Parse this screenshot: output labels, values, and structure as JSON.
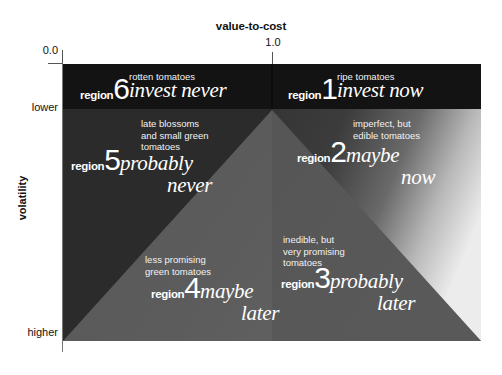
{
  "axes": {
    "x_title": "value-to-cost",
    "x_tick_origin": "0.0",
    "x_tick_one": "1.0",
    "y_title": "volatility",
    "y_tick_top": "lower",
    "y_tick_bottom": "higher"
  },
  "colors": {
    "header_band": "#111111",
    "left_quadrant": "#2b2b2b",
    "right_quadrant": "#3a3a3a",
    "triangle": "#5b5b5b",
    "gradient_light": "#e8e8e8",
    "text": "#ffffff",
    "page_background": "#ffffff",
    "axis_line": "#777777"
  },
  "regions": [
    {
      "id": "region-6",
      "label": "region",
      "number": "6",
      "caption": "rotten tomatoes",
      "action": "invest never",
      "action_line1": "invest never",
      "action_line2": ""
    },
    {
      "id": "region-1",
      "label": "region",
      "number": "1",
      "caption": "ripe tomatoes",
      "action": "invest now",
      "action_line1": "invest now",
      "action_line2": ""
    },
    {
      "id": "region-5",
      "label": "region",
      "number": "5",
      "caption": "late blossoms\nand small green\ntomatoes",
      "caption_line1": "late blossoms",
      "caption_line2": "and small green",
      "caption_line3": "tomatoes",
      "action": "probably never",
      "action_line1": "probably",
      "action_line2": "never"
    },
    {
      "id": "region-2",
      "label": "region",
      "number": "2",
      "caption": "imperfect, but\nedible tomatoes",
      "caption_line1": "imperfect, but",
      "caption_line2": "edible tomatoes",
      "caption_line3": "",
      "action": "maybe now",
      "action_line1": "maybe",
      "action_line2": "now"
    },
    {
      "id": "region-4",
      "label": "region",
      "number": "4",
      "caption": "less promising\ngreen tomatoes",
      "caption_line1": "less promising",
      "caption_line2": "green tomatoes",
      "caption_line3": "",
      "action": "maybe later",
      "action_line1": "maybe",
      "action_line2": "later"
    },
    {
      "id": "region-3",
      "label": "region",
      "number": "3",
      "caption": "inedible, but\nvery promising\ntomatoes",
      "caption_line1": "inedible, but",
      "caption_line2": "very promising",
      "caption_line3": "tomatoes",
      "action": "probably later",
      "action_line1": "probably",
      "action_line2": "later"
    }
  ]
}
